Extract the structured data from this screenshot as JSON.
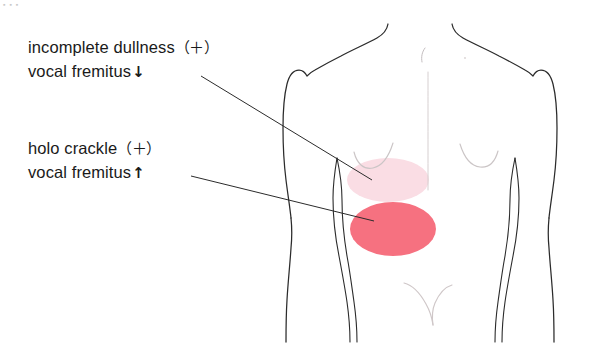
{
  "diagram": {
    "corner_artifact": "▪ ▪ ▪",
    "background_color": "#ffffff",
    "outline_color": "#2b2b2b",
    "faint_line_color": "#c8c2c2"
  },
  "labels": {
    "upper": {
      "name": "incomplete-dullness",
      "line1_text": "incomplete dullness",
      "line1_sign": "（＋）",
      "line2_text": "vocal fremitus",
      "line2_arrow": "↓"
    },
    "lower": {
      "name": "holo-crackle",
      "line1_text": "holo crackle",
      "line1_sign": "（＋）",
      "line2_text": "vocal fremitus",
      "line2_arrow": "↑"
    }
  },
  "regions": {
    "upper_zone": {
      "label": "incomplete dullness zone",
      "color": "#fadde4",
      "cx": 388,
      "cy": 180,
      "rx": 41,
      "ry": 22
    },
    "lower_zone": {
      "label": "holo crackle zone",
      "color": "#f67180",
      "cx": 393,
      "cy": 229,
      "rx": 43,
      "ry": 27
    }
  },
  "leader_lines": {
    "upper": {
      "x1": 201,
      "y1": 76,
      "x2": 372,
      "y2": 180
    },
    "lower": {
      "x1": 191,
      "y1": 176,
      "x2": 374,
      "y2": 221
    }
  }
}
